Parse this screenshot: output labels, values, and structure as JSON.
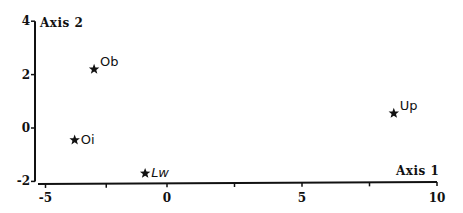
{
  "chart_data": {
    "type": "scatter",
    "title": "",
    "xlabel": "Axis 1",
    "ylabel": "Axis 2",
    "xlim": [
      -5,
      10
    ],
    "ylim": [
      -2,
      4
    ],
    "x_ticks": [
      -5,
      0,
      5,
      10
    ],
    "x_minor_ticks": [
      -2.5,
      2.5,
      7.5
    ],
    "y_ticks": [
      4,
      2,
      0,
      -2
    ],
    "grid": false,
    "legend": null,
    "marker": "star",
    "points": [
      {
        "label": "Ob",
        "x": -3.0,
        "y": 2.2,
        "italic": false
      },
      {
        "label": "Oi",
        "x": -3.8,
        "y": -0.45,
        "italic": false
      },
      {
        "label": "Lw",
        "x": -0.9,
        "y": -1.7,
        "italic": true
      },
      {
        "label": "Up",
        "x": 8.4,
        "y": 0.55,
        "italic": false
      }
    ]
  },
  "colors": {
    "ink": "#111111",
    "background": "#ffffff"
  }
}
